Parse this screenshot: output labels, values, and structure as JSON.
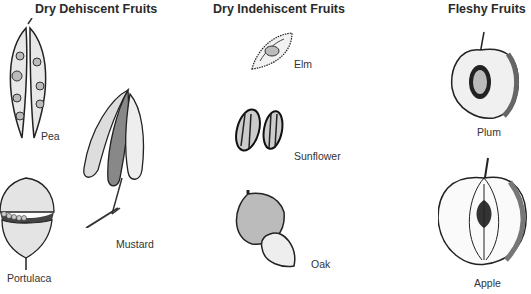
{
  "diagram": {
    "categories": [
      {
        "title": "Dry Dehiscent Fruits",
        "fruits": [
          {
            "name": "Pea",
            "icon": "pea-pod-icon"
          },
          {
            "name": "Mustard",
            "icon": "mustard-silique-icon"
          },
          {
            "name": "Portulaca",
            "icon": "portulaca-capsule-icon"
          }
        ]
      },
      {
        "title": "Dry Indehiscent Fruits",
        "fruits": [
          {
            "name": "Elm",
            "icon": "elm-samara-icon"
          },
          {
            "name": "Sunflower",
            "icon": "sunflower-achene-icon"
          },
          {
            "name": "Oak",
            "icon": "acorn-icon"
          }
        ]
      },
      {
        "title": "Fleshy Fruits",
        "fruits": [
          {
            "name": "Plum",
            "icon": "plum-cross-section-icon"
          },
          {
            "name": "Apple",
            "icon": "apple-cross-section-icon"
          }
        ]
      }
    ]
  }
}
